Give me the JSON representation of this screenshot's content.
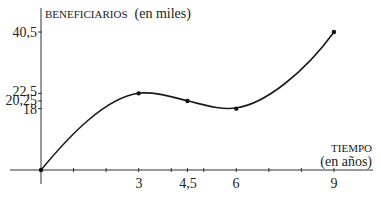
{
  "chart_data": {
    "type": "line",
    "title": "",
    "ylabel": "BENEFICIARIOS (en miles)",
    "ylabel_caps": "BENEFICIARIOS",
    "ylabel_unit": "(en miles)",
    "xlabel": "TIEMPO (en años)",
    "xlabel_caps": "TIEMPO",
    "xlabel_unit": "(en años)",
    "x": [
      0,
      3,
      4.5,
      6,
      9
    ],
    "values": [
      0,
      22.5,
      20.25,
      18,
      40.5
    ],
    "points": [
      {
        "x": 0,
        "y": 0
      },
      {
        "x": 3,
        "y": 22.5
      },
      {
        "x": 4.5,
        "y": 20.25
      },
      {
        "x": 6,
        "y": 18
      },
      {
        "x": 9,
        "y": 40.5
      }
    ],
    "x_tick_labels": [
      "3",
      "4,5",
      "6",
      "9"
    ],
    "x_tick_values": [
      3,
      4.5,
      6,
      9
    ],
    "x_minor_ticks": [
      1,
      2,
      3,
      4,
      4.5,
      5,
      6,
      7,
      8,
      9
    ],
    "y_tick_labels": [
      "40,5",
      "22,5",
      "20,25",
      "18"
    ],
    "y_tick_values": [
      40.5,
      22.5,
      20.25,
      18
    ],
    "xlim": [
      0,
      10
    ],
    "ylim": [
      0,
      45
    ],
    "grid": false,
    "legend": null,
    "curve_color": "#1a1a1a"
  }
}
